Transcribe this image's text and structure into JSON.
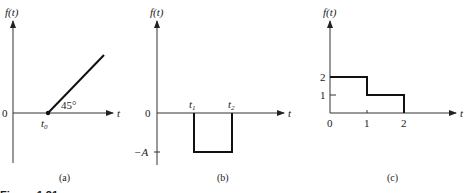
{
  "figure_caption": "Figure 1.31",
  "panels": [
    {
      "id": "a",
      "caption": "(a)",
      "y_label": "f(t)",
      "x_label": "t",
      "origin_label": "0",
      "t0_label": "t",
      "t0_sub": "0",
      "angle_label": "45°",
      "description": "Ramp starting at t0 with 45° slope"
    },
    {
      "id": "b",
      "caption": "(b)",
      "y_label": "f(t)",
      "x_label": "t",
      "origin_label": "0",
      "neg_level_label": "−A",
      "t1_label": "t",
      "t1_sub": "1",
      "t2_label": "t",
      "t2_sub": "2",
      "description": "Negative rectangular pulse of height -A between t1 and t2"
    },
    {
      "id": "c",
      "caption": "(c)",
      "y_label": "f(t)",
      "x_label": "t",
      "y_ticks": [
        "2",
        "1"
      ],
      "x_ticks": [
        "0",
        "1",
        "2"
      ],
      "steps": [
        {
          "from": 0,
          "to": 1,
          "value": 2
        },
        {
          "from": 1,
          "to": 2,
          "value": 1
        }
      ],
      "description": "Staircase: 2 on [0,1], 1 on [1,2], 0 after"
    }
  ]
}
